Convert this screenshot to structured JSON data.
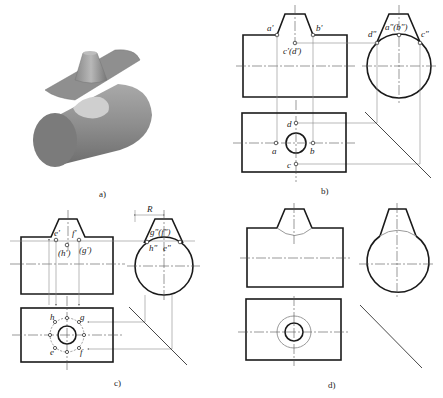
{
  "figure": {
    "panels": [
      {
        "id": "a",
        "caption": "a)",
        "description": "3D exploded view: conical boss on plate above cylinder with circular intersection patch"
      },
      {
        "id": "b",
        "caption": "b)",
        "description": "Three-view projection with special points a, b, c, d"
      },
      {
        "id": "c",
        "caption": "c)",
        "description": "Three-view projection with general points e, f, g, h and radius R"
      },
      {
        "id": "d",
        "caption": "d)",
        "description": "Completed three-view with intersection curves"
      }
    ],
    "labels_b": {
      "a_front": "a'",
      "b_front": "b'",
      "cd_front": "c'(d')",
      "ab_side": "a\"(b\")",
      "d_side": "d\"",
      "c_side": "c\"",
      "d_top": "d",
      "a_top": "a",
      "b_top": "b",
      "c_top": "c"
    },
    "labels_c": {
      "e_front": "e'",
      "f_front": "f'",
      "h_front": "(h')",
      "g_front": "(g')",
      "radius": "R",
      "gf_side": "g\"(f\")",
      "h_side": "h\"",
      "e_side": "e\"",
      "h_top": "h",
      "g_top": "g",
      "e_top": "e",
      "f_top": "f"
    },
    "colors": {
      "outline": "#1a1a1a",
      "projection_lines": "#8a8a8a",
      "intersection_curve": "#9a9a9a",
      "solid_body": "#8c8c8c",
      "intersection_patch": "#cfcfcf"
    }
  }
}
